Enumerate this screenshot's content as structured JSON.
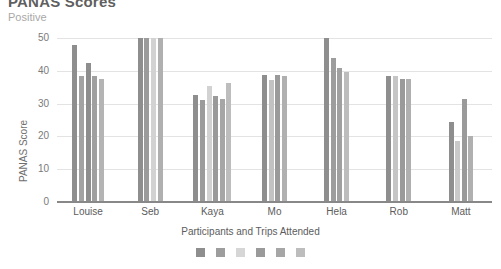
{
  "header": {
    "title": "PANAS Scores",
    "subtitle": "Positive"
  },
  "chart_data": {
    "type": "bar",
    "title": "PANAS Scores",
    "subtitle": "Positive",
    "xlabel": "Participants and Trips Attended",
    "ylabel": "PANAS Score",
    "ylim": [
      0,
      50
    ],
    "yticks": [
      0,
      10,
      20,
      30,
      40,
      50
    ],
    "ytick_labels": [
      "0",
      "10",
      "20",
      "30",
      "40",
      "50"
    ],
    "grid": true,
    "legend_position": "bottom",
    "legend": [
      {
        "label": "",
        "color": "#8e8e8e"
      },
      {
        "label": "",
        "color": "#9d9d9d"
      },
      {
        "label": "",
        "color": "#d6d6d6"
      },
      {
        "label": "",
        "color": "#9a9a9a"
      },
      {
        "label": "",
        "color": "#a6a6a6"
      },
      {
        "label": "",
        "color": "#bdbdbd"
      }
    ],
    "categories": [
      "Louise",
      "Seb",
      "Kaya",
      "Mo",
      "Hela",
      "Rob",
      "Matt"
    ],
    "groups": [
      {
        "category": "Louise",
        "bars": [
          {
            "value": 48.0,
            "color": "#8e8e8e"
          },
          {
            "value": 38.5,
            "color": "#a3a3a3"
          },
          {
            "value": 42.5,
            "color": "#8e8e8e"
          },
          {
            "value": 38.3,
            "color": "#a0a0a0"
          },
          {
            "value": 37.5,
            "color": "#b4b4b4"
          }
        ]
      },
      {
        "category": "Seb",
        "bars": [
          {
            "value": 50.0,
            "color": "#8e8e8e"
          },
          {
            "value": 50.0,
            "color": "#9b9b9b"
          },
          {
            "value": 50.0,
            "color": "#d2d2d2"
          },
          {
            "value": 50.0,
            "color": "#b0b0b0"
          }
        ]
      },
      {
        "category": "Kaya",
        "bars": [
          {
            "value": 32.5,
            "color": "#8e8e8e"
          },
          {
            "value": 31.0,
            "color": "#9b9b9b"
          },
          {
            "value": 35.3,
            "color": "#d2d2d2"
          },
          {
            "value": 32.3,
            "color": "#9a9a9a"
          },
          {
            "value": 31.5,
            "color": "#a6a6a6"
          },
          {
            "value": 36.3,
            "color": "#bdbdbd"
          }
        ]
      },
      {
        "category": "Mo",
        "bars": [
          {
            "value": 38.6,
            "color": "#8e8e8e"
          },
          {
            "value": 37.3,
            "color": "#c2c2c2"
          },
          {
            "value": 38.8,
            "color": "#9a9a9a"
          },
          {
            "value": 38.3,
            "color": "#b0b0b0"
          }
        ]
      },
      {
        "category": "Hela",
        "bars": [
          {
            "value": 50.0,
            "color": "#8e8e8e"
          },
          {
            "value": 44.0,
            "color": "#9d9d9d"
          },
          {
            "value": 41.0,
            "color": "#a0a0a0"
          },
          {
            "value": 39.5,
            "color": "#bdbdbd"
          }
        ]
      },
      {
        "category": "Rob",
        "bars": [
          {
            "value": 38.3,
            "color": "#8e8e8e"
          },
          {
            "value": 38.3,
            "color": "#c5c5c5"
          },
          {
            "value": 37.6,
            "color": "#9a9a9a"
          },
          {
            "value": 37.6,
            "color": "#b0b0b0"
          }
        ]
      },
      {
        "category": "Matt",
        "bars": [
          {
            "value": 24.5,
            "color": "#8e8e8e"
          },
          {
            "value": 18.6,
            "color": "#c9c9c9"
          },
          {
            "value": 31.5,
            "color": "#9a9a9a"
          },
          {
            "value": 20.0,
            "color": "#b0b0b0"
          }
        ]
      }
    ]
  }
}
